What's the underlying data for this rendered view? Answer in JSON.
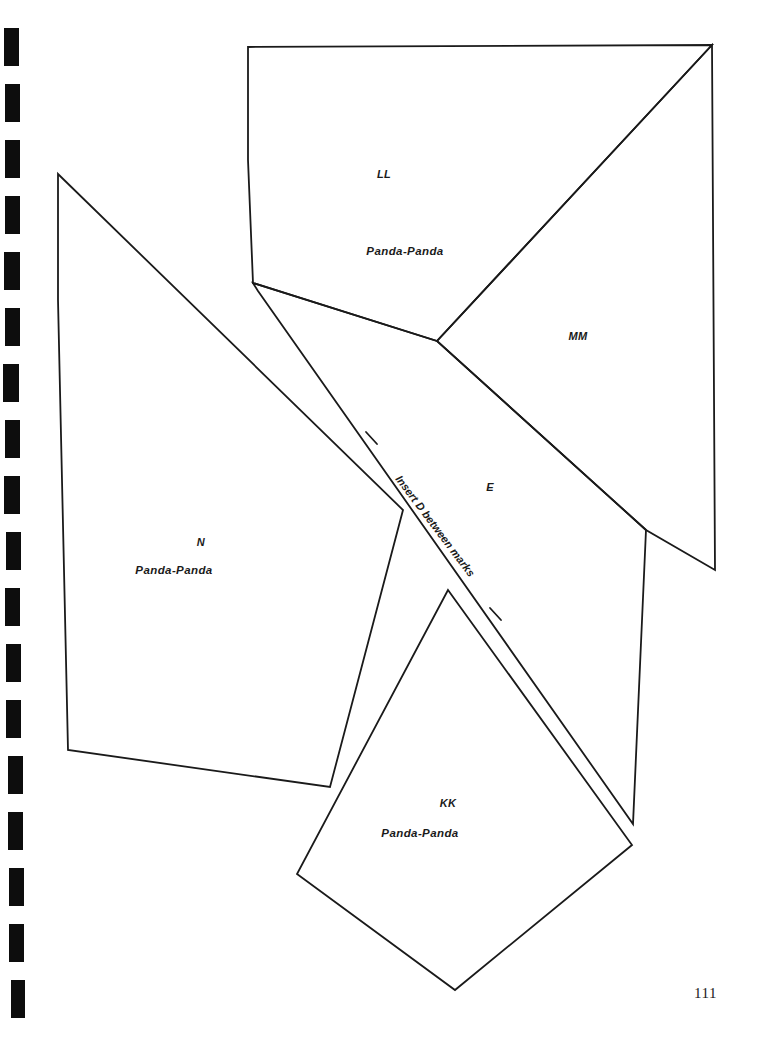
{
  "page": {
    "width": 763,
    "height": 1049,
    "background_color": "#ffffff",
    "ink_color": "#1a1a1a",
    "page_number": "111"
  },
  "binding": {
    "name": "spiral-binding-marks",
    "color": "#0d0d0d",
    "count": 18,
    "marks": [
      {
        "x": 4,
        "y": 28,
        "w": 15,
        "h": 38
      },
      {
        "x": 5,
        "y": 84,
        "w": 15,
        "h": 38
      },
      {
        "x": 5,
        "y": 140,
        "w": 15,
        "h": 38
      },
      {
        "x": 5,
        "y": 196,
        "w": 15,
        "h": 38
      },
      {
        "x": 4,
        "y": 252,
        "w": 16,
        "h": 38
      },
      {
        "x": 5,
        "y": 308,
        "w": 15,
        "h": 38
      },
      {
        "x": 3,
        "y": 364,
        "w": 16,
        "h": 38
      },
      {
        "x": 5,
        "y": 420,
        "w": 15,
        "h": 38
      },
      {
        "x": 4,
        "y": 476,
        "w": 16,
        "h": 38
      },
      {
        "x": 6,
        "y": 532,
        "w": 15,
        "h": 38
      },
      {
        "x": 5,
        "y": 588,
        "w": 15,
        "h": 38
      },
      {
        "x": 6,
        "y": 644,
        "w": 15,
        "h": 38
      },
      {
        "x": 6,
        "y": 700,
        "w": 15,
        "h": 38
      },
      {
        "x": 8,
        "y": 756,
        "w": 15,
        "h": 38
      },
      {
        "x": 8,
        "y": 812,
        "w": 15,
        "h": 38
      },
      {
        "x": 9,
        "y": 868,
        "w": 15,
        "h": 38
      },
      {
        "x": 9,
        "y": 924,
        "w": 15,
        "h": 38
      },
      {
        "x": 11,
        "y": 980,
        "w": 14,
        "h": 38
      }
    ]
  },
  "pieces": [
    {
      "id": "LL",
      "name": "pattern-piece-LL",
      "code": "LL",
      "brand": "Panda-Panda",
      "code_pos": {
        "x": 384,
        "y": 174
      },
      "brand_pos": {
        "x": 405,
        "y": 251
      },
      "outline": "248,47 712,45 437,341 253,283 248,160"
    },
    {
      "id": "MM",
      "name": "pattern-piece-MM",
      "code": "MM",
      "brand": "",
      "code_pos": {
        "x": 578,
        "y": 336
      },
      "brand_pos": null,
      "outline": "712,45 715,570 646,530 437,341"
    },
    {
      "id": "N",
      "name": "pattern-piece-N",
      "code": "N",
      "brand": "Panda-Panda",
      "code_pos": {
        "x": 201,
        "y": 542
      },
      "brand_pos": {
        "x": 174,
        "y": 570
      },
      "outline": "58,174 403,510 330,787 68,750 58,300"
    },
    {
      "id": "E",
      "name": "pattern-piece-E",
      "code": "E",
      "brand": "",
      "code_pos": {
        "x": 490,
        "y": 487
      },
      "brand_pos": null,
      "outline": "253,283 437,341 646,530 633,824 258,291"
    },
    {
      "id": "KK",
      "name": "pattern-piece-KK",
      "code": "KK",
      "brand": "Panda-Panda",
      "code_pos": {
        "x": 448,
        "y": 803
      },
      "brand_pos": {
        "x": 420,
        "y": 833
      },
      "outline": "448,590 632,845 455,990 297,874"
    }
  ],
  "notations": {
    "insert_note": {
      "name": "insert-d-between-marks-note",
      "text": "Insert D between marks",
      "x": 403,
      "y": 473,
      "rotation_deg": 53
    },
    "tick_marks": [
      {
        "name": "notch-mark-upper",
        "x1": 366,
        "y1": 432,
        "x2": 377,
        "y2": 444
      },
      {
        "name": "notch-mark-lower",
        "x1": 490,
        "y1": 608,
        "x2": 501,
        "y2": 620
      }
    ]
  }
}
